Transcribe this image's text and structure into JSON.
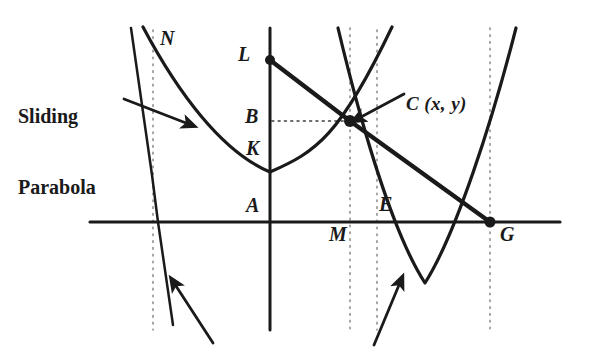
{
  "figure": {
    "colors": {
      "ink": "#1a1a1a",
      "curve": "#1d1d1d",
      "dotted": "#8c8c8c",
      "background": "#ffffff"
    }
  },
  "annotations": {
    "sliding_parabola_line1": "Sliding",
    "sliding_parabola_line2": "Parabola",
    "point_c": "C (x, y)"
  },
  "point_labels": {
    "n": "N",
    "l": "L",
    "b": "B",
    "k": "K",
    "a": "A",
    "e": "E",
    "m": "M",
    "g": "G"
  },
  "geometry": {
    "origin": {
      "x": 270,
      "y": 222
    },
    "points": [
      {
        "name": "L",
        "x": 270,
        "y": 60,
        "marker": "dot"
      },
      {
        "name": "C",
        "x": 350,
        "y": 121,
        "marker": "dot"
      },
      {
        "name": "G",
        "x": 490,
        "y": 222,
        "marker": "dot"
      },
      {
        "name": "K",
        "x": 270,
        "y": 172,
        "marker": "none"
      },
      {
        "name": "B",
        "x": 270,
        "y": 121,
        "marker": "none"
      },
      {
        "name": "A",
        "x": 270,
        "y": 222,
        "marker": "none"
      },
      {
        "name": "E",
        "x": 377,
        "y": 222,
        "marker": "none"
      },
      {
        "name": "M",
        "x": 377,
        "y": 222,
        "marker": "none"
      }
    ],
    "axes": {
      "horizontal": {
        "x1": 90,
        "y1": 222,
        "x2": 560,
        "y2": 222
      },
      "vertical": {
        "x1": 270,
        "y1": 28,
        "x2": 270,
        "y2": 330
      }
    },
    "dotted_verticals": [
      153,
      350,
      377,
      490
    ],
    "dotted_horizontal": {
      "x1": 272,
      "y": 121,
      "x2": 350
    },
    "fixed_parabola": {
      "vertex_x": 270,
      "vertex_y": 172,
      "opens": "up"
    },
    "sliding_parabola": {
      "vertex_x": 425,
      "vertex_y": 283,
      "opens": "up"
    },
    "steep_line": {
      "x1": 131,
      "y1": 28,
      "x2": 173,
      "y2": 325
    },
    "chord": {
      "from": "L",
      "via": "C",
      "to": "G"
    }
  }
}
